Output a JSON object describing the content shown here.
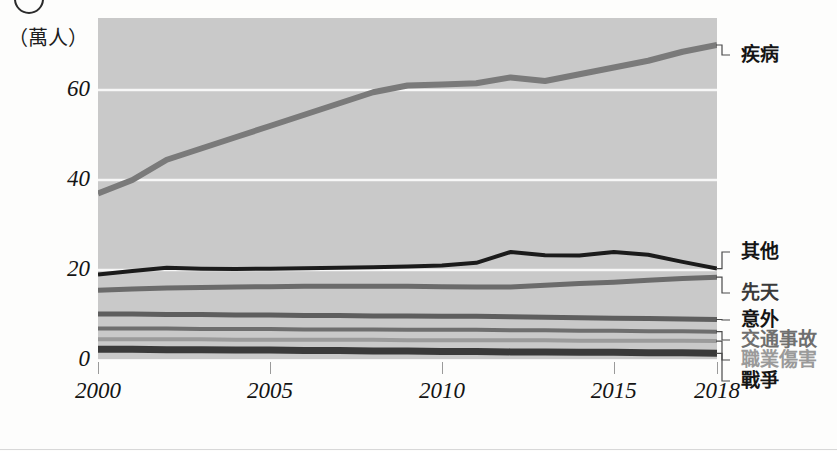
{
  "figure": {
    "unit_caption": "（萬人）",
    "corner_marker": "circle-marker"
  },
  "chart_data": {
    "type": "line",
    "title": "",
    "xlabel": "",
    "ylabel": "（萬人）",
    "unit": "萬人",
    "grid": true,
    "legend_position": "right-callouts",
    "xlim": [
      2000,
      2018
    ],
    "ylim": [
      0,
      76
    ],
    "yticks": [
      0,
      20,
      40,
      60
    ],
    "xticks": [
      2000,
      2005,
      2010,
      2015,
      2018
    ],
    "xtick_labels": [
      "2000",
      "2005",
      "2010",
      "2015",
      "2018"
    ],
    "ytick_labels": [
      "0",
      "20",
      "40",
      "60"
    ],
    "x": [
      2000,
      2001,
      2002,
      2003,
      2004,
      2005,
      2006,
      2007,
      2008,
      2009,
      2010,
      2011,
      2012,
      2013,
      2014,
      2015,
      2016,
      2017,
      2018
    ],
    "series": [
      {
        "name": "疾病",
        "color": "#7a7a7a",
        "width": 6,
        "values": [
          37,
          40,
          44.5,
          47,
          49.5,
          52,
          54.5,
          57,
          59.5,
          61,
          61.2,
          61.5,
          62.8,
          62,
          63.5,
          65,
          66.5,
          68.5,
          70
        ]
      },
      {
        "name": "其他",
        "color": "#1b1b1b",
        "width": 4,
        "values": [
          19,
          19.8,
          20.5,
          20.3,
          20.2,
          20.3,
          20.4,
          20.5,
          20.6,
          20.8,
          21,
          21.6,
          24,
          23.3,
          23.2,
          24,
          23.4,
          21.8,
          20.3
        ]
      },
      {
        "name": "先天",
        "color": "#6b6b6b",
        "width": 5,
        "values": [
          15.5,
          15.8,
          16,
          16.1,
          16.2,
          16.3,
          16.4,
          16.4,
          16.4,
          16.4,
          16.3,
          16.2,
          16.2,
          16.6,
          17,
          17.3,
          17.7,
          18.1,
          18.4
        ]
      },
      {
        "name": "意外",
        "color": "#5e5e5e",
        "width": 5,
        "values": [
          10.2,
          10.2,
          10.1,
          10.1,
          10,
          10,
          9.9,
          9.9,
          9.8,
          9.8,
          9.7,
          9.7,
          9.6,
          9.5,
          9.4,
          9.3,
          9.2,
          9.1,
          9
        ]
      },
      {
        "name": "交通事故",
        "color": "#6e6e6e",
        "width": 4,
        "values": [
          7,
          7,
          7,
          6.9,
          6.9,
          6.9,
          6.8,
          6.8,
          6.8,
          6.7,
          6.7,
          6.7,
          6.6,
          6.6,
          6.5,
          6.5,
          6.4,
          6.4,
          6.3
        ]
      },
      {
        "name": "職業傷害",
        "color": "#9b9b9b",
        "width": 4,
        "values": [
          4.6,
          4.6,
          4.6,
          4.6,
          4.5,
          4.5,
          4.5,
          4.5,
          4.5,
          4.4,
          4.4,
          4.4,
          4.4,
          4.4,
          4.3,
          4.3,
          4.3,
          4.3,
          4.2
        ]
      },
      {
        "name": "戰爭",
        "color": "#3a3a3a",
        "width": 7,
        "values": [
          2.4,
          2.4,
          2.3,
          2.3,
          2.2,
          2.2,
          2.1,
          2.1,
          2.0,
          2.0,
          1.9,
          1.9,
          1.8,
          1.8,
          1.7,
          1.7,
          1.6,
          1.6,
          1.5
        ]
      }
    ]
  },
  "callouts": [
    {
      "name": "疾病",
      "label": "疾病",
      "tone": "c-strong"
    },
    {
      "name": "其他",
      "label": "其他",
      "tone": "c-strong"
    },
    {
      "name": "先天",
      "label": "先天",
      "tone": "c-mid"
    },
    {
      "name": "意外",
      "label": "意外",
      "tone": "c-strong"
    },
    {
      "name": "交通事故",
      "label": "交通事故",
      "tone": "c-soft"
    },
    {
      "name": "職業傷害",
      "label": "職業傷害",
      "tone": "c-faint"
    },
    {
      "name": "戰爭",
      "label": "戰爭",
      "tone": "c-strong"
    }
  ]
}
